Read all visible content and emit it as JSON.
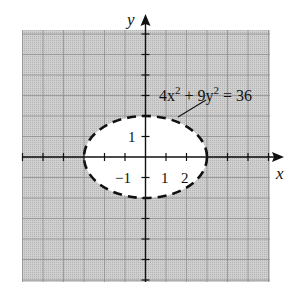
{
  "chart_data": {
    "type": "line",
    "title": "",
    "xlabel": "x",
    "ylabel": "y",
    "xlim": [
      -6,
      6
    ],
    "ylim": [
      -6,
      6
    ],
    "grid": true,
    "grid_step": 1,
    "x_tick_labels": [
      {
        "value": -1,
        "label": "−1"
      },
      {
        "value": 1,
        "label": "1"
      },
      {
        "value": 2,
        "label": "2"
      }
    ],
    "y_tick_labels": [
      {
        "value": 1,
        "label": "1"
      }
    ],
    "series": [
      {
        "name": "4x^2 + 9y^2 = 36",
        "kind": "ellipse",
        "center": [
          0,
          0
        ],
        "semi_axis_x": 3,
        "semi_axis_y": 2,
        "line_style": "dashed",
        "interior": "unshaded",
        "exterior": "shaded"
      }
    ],
    "shaded_region": "4x^2 + 9y^2 > 36",
    "annotation": {
      "text_parts": [
        "4x",
        "2",
        " + 9y",
        "2",
        " = 36"
      ],
      "points_to": [
        1.6,
        1.95
      ]
    }
  },
  "labels": {
    "x_axis": "x",
    "y_axis": "y",
    "equation_base1": "4x",
    "equation_exp1": "2",
    "equation_mid": " + 9y",
    "equation_exp2": "2",
    "equation_end": " = 36",
    "tick_x_neg1": "−1",
    "tick_x_1": "1",
    "tick_x_2": "2",
    "tick_y_1": "1"
  },
  "colors": {
    "shade": "#c9c9c9",
    "grid": "#9a9a9a",
    "axis": "#111111",
    "curve": "#111111",
    "interior": "#ffffff"
  }
}
